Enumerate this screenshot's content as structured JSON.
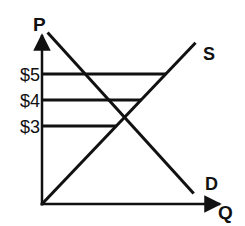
{
  "chart_data": {
    "type": "line",
    "title": "",
    "xlabel": "Q",
    "ylabel": "P",
    "xlim": [
      0,
      10
    ],
    "ylim": [
      0,
      7.5
    ],
    "grid": false,
    "price_lines": [
      {
        "label": "$5",
        "price": 5
      },
      {
        "label": "$4",
        "price": 4
      },
      {
        "label": "$3",
        "price": 3
      }
    ],
    "series": [
      {
        "name": "S",
        "label": "S",
        "points": [
          [
            0,
            0
          ],
          [
            8.3,
            6.2
          ]
        ]
      },
      {
        "name": "D",
        "label": "D",
        "points": [
          [
            0.3,
            6.6
          ],
          [
            8.2,
            0.4
          ]
        ]
      }
    ],
    "equilibrium": {
      "price": 3
    }
  },
  "colors": {
    "ink": "#111111",
    "background": "#ffffff"
  }
}
